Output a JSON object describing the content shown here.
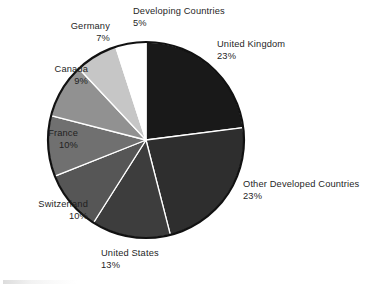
{
  "chart_data": {
    "type": "pie",
    "title": "",
    "subtitle": "",
    "xlabel": "",
    "ylabel": "",
    "legend_position": "callout-labels",
    "grid": false,
    "start_angle_deg": 0,
    "direction": "clockwise",
    "value_unit": "percent",
    "categories": [
      "United Kingdom",
      "Other Developed Countries",
      "United States",
      "Switzerland",
      "France",
      "Canada",
      "Germany",
      "Developing Countries"
    ],
    "values": [
      23,
      23,
      13,
      10,
      10,
      9,
      7,
      5
    ],
    "slices": [
      {
        "label": "United Kingdom",
        "value": 23,
        "value_text": "23%",
        "color": "#191919",
        "label_position": "right",
        "label_align": "align-left"
      },
      {
        "label": "Other Developed Countries",
        "value": 23,
        "value_text": "23%",
        "color": "#2e2e2e",
        "label_position": "right",
        "label_align": "align-left"
      },
      {
        "label": "United States",
        "value": 13,
        "value_text": "13%",
        "color": "#3d3d3d",
        "label_position": "bottom",
        "label_align": "align-left"
      },
      {
        "label": "Switzerland",
        "value": 10,
        "value_text": "10%",
        "color": "#565656",
        "label_position": "left",
        "label_align": "align-right"
      },
      {
        "label": "France",
        "value": 10,
        "value_text": "10%",
        "color": "#707070",
        "label_position": "left",
        "label_align": "align-right"
      },
      {
        "label": "Canada",
        "value": 9,
        "value_text": "9%",
        "color": "#919191",
        "label_position": "left",
        "label_align": "align-right"
      },
      {
        "label": "Germany",
        "value": 7,
        "value_text": "7%",
        "color": "#c6c6c6",
        "label_position": "top-left",
        "label_align": "align-right"
      },
      {
        "label": "Developing Countries",
        "value": 5,
        "value_text": "5%",
        "color": "#ffffff",
        "label_position": "top",
        "label_align": "align-left"
      }
    ],
    "style": {
      "outline_color": "#111111",
      "separator_color": "#ffffff",
      "background": "#ffffff",
      "center_x": 146,
      "center_y": 140,
      "radius": 98
    }
  }
}
